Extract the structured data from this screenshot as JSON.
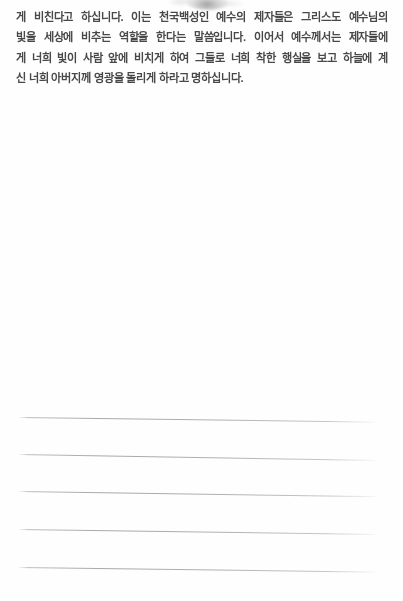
{
  "document": {
    "type": "scanned-book-page",
    "language": "ko",
    "background_color": "#fefefe",
    "text_color": "#3b3b3b",
    "rule_color": "#8a8a8d"
  },
  "body_text": {
    "lines": [
      "게 비친다고 하십니다. 이는 천국백성인 예수의 제자들은 그리스도 예수님의",
      "빛을 세상에 비추는 역할을 한다는 말씀입니다. 이어서 예수께서는 제자들에",
      "게 너희 빛이 사람 앞에 비치게 하여 그들로 너희 착한 행실을 보고 하늘에 계",
      "신 너희 아버지께 영광을 돌리게 하라고 명하십니다."
    ],
    "full_text": "게 비친다고 하십니다. 이는 천국백성인 예수의 제자들은 그리스도 예수님의 빛을 세상에 비추는 역할을 한다는 말씀입니다. 이어서 예수께서는 제자들에게 너희 빛이 사람 앞에 비치게 하여 그들로 너희 착한 행실을 보고 하늘에 계신 너희 아버지께 영광을 돌리게 하라고 명하십니다."
  },
  "note_area": {
    "label": "blank ruled writing lines",
    "line_count": 5,
    "lines": [
      {
        "top": 417,
        "left": 18,
        "width": 362,
        "slope_deg": 0.75
      },
      {
        "top": 454,
        "left": 18,
        "width": 362,
        "slope_deg": 0.95
      },
      {
        "top": 491,
        "left": 18,
        "width": 362,
        "slope_deg": 0.85
      },
      {
        "top": 529,
        "left": 18,
        "width": 362,
        "slope_deg": 0.8
      },
      {
        "top": 567,
        "left": 18,
        "width": 362,
        "slope_deg": 0.75
      }
    ]
  },
  "artifacts": {
    "top_smudge": "faint gray scanner smudge at top center"
  }
}
